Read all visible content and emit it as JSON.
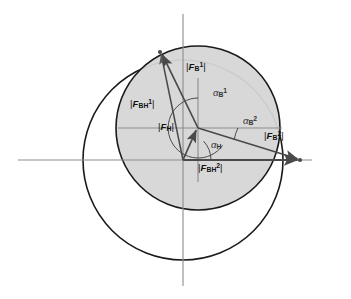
{
  "figure": {
    "type": "vector-force-diagram",
    "background": "#ffffff",
    "shaded_fill": "#d6d6d6",
    "outline_color": "#1a1a1a",
    "axis_color": "#8c8c8c",
    "vector_color": "#4a4a4a"
  },
  "labels": {
    "f_b1": {
      "pre": "|",
      "sym": "F",
      "sub": "B",
      "sup": "1",
      "post": "|",
      "text": "|F_B1|"
    },
    "f_bh1": {
      "pre": "|",
      "sym": "F",
      "sub": "BH",
      "sup": "1",
      "post": "|",
      "text": "|F_BH1|"
    },
    "f_h": {
      "pre": "|",
      "sym": "F",
      "sub": "H",
      "sup": "",
      "post": "|",
      "text": "|F_H|"
    },
    "f_b2": {
      "pre": "|",
      "sym": "F",
      "sub": "B",
      "sup": "2",
      "post": "|",
      "text": "|F_B2|"
    },
    "f_bh2": {
      "pre": "|",
      "sym": "F",
      "sub": "BH",
      "sup": "2",
      "post": "|",
      "text": "|F_BH2|"
    }
  },
  "angles": {
    "alpha_h": {
      "sym": "α",
      "sub": "H",
      "sup": "",
      "text": "alpha_H"
    },
    "alpha_b1": {
      "sym": "α",
      "sub": "B",
      "sup": "1",
      "text": "alpha_B1"
    },
    "alpha_b2": {
      "sym": "α",
      "sub": "B",
      "sup": "2",
      "text": "alpha_B2"
    }
  },
  "geometry": {
    "origin": {
      "x": 183,
      "y": 160
    },
    "hub": {
      "x": 198,
      "y": 128
    },
    "tip_upper_left": {
      "x": 160,
      "y": 52
    },
    "tip_right": {
      "x": 300,
      "y": 160
    },
    "big_circle": {
      "cx": 183,
      "cy": 160,
      "r": 100
    },
    "shaded_circle": {
      "cx": 198,
      "cy": 128,
      "r": 82
    },
    "h_axis": {
      "x1": 18,
      "y1": 160,
      "x2": 312,
      "y2": 160
    },
    "v_axis": {
      "x1": 183,
      "y1": 14,
      "x2": 183,
      "y2": 286
    },
    "h_guide": {
      "x1": 118,
      "y1": 128,
      "x2": 280,
      "y2": 128
    },
    "v_guide": {
      "x1": 198,
      "y1": 78,
      "x2": 198,
      "y2": 182
    }
  }
}
